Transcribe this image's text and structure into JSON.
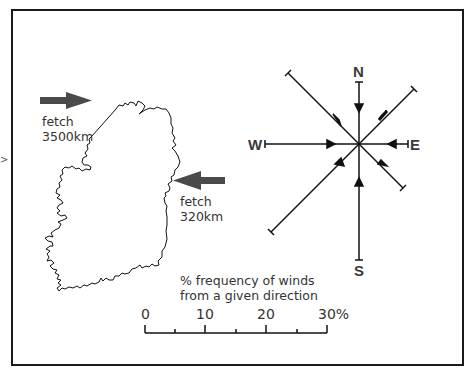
{
  "figure": {
    "type": "wind-rose-map",
    "colors": {
      "frame": "#1a1a1a",
      "arrow": "#4a4a4a",
      "line": "#111111",
      "text": "#333333"
    }
  },
  "map": {
    "region": "Ireland outline",
    "fetch_arrows": [
      {
        "direction": "from west (pointing east)",
        "label_line1": "fetch",
        "label_line2": "3500km"
      },
      {
        "direction": "from east (pointing west)",
        "label_line1": "fetch",
        "label_line2": "320km"
      }
    ]
  },
  "compass": {
    "labels": {
      "north": "N",
      "south": "S",
      "east": "E",
      "west": "W"
    },
    "rays": [
      {
        "direction": "N",
        "length_pct": 10
      },
      {
        "direction": "NE",
        "length_pct": 13
      },
      {
        "direction": "E",
        "length_pct": 4
      },
      {
        "direction": "SE",
        "length_pct": 10
      },
      {
        "direction": "S",
        "length_pct": 19
      },
      {
        "direction": "SW",
        "length_pct": 22
      },
      {
        "direction": "W",
        "length_pct": 20
      },
      {
        "direction": "NW",
        "length_pct": 20
      }
    ]
  },
  "scale": {
    "caption_line1": "% frequency of winds",
    "caption_line2": "from a given direction",
    "ticks": [
      "0",
      "10",
      "20",
      "30%"
    ]
  },
  "edge_glyph": ">"
}
